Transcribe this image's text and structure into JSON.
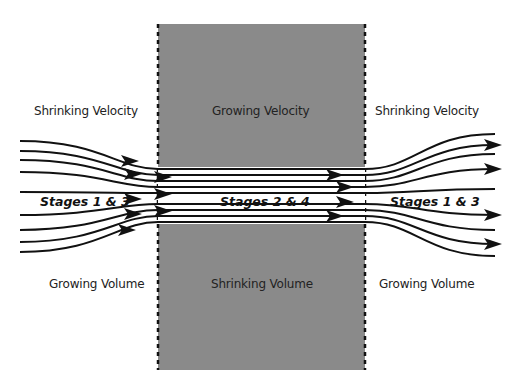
{
  "colors": {
    "background": "#ffffff",
    "nozzle_fill": "#8a8a8a",
    "border_dash": "#111111",
    "streamline": "#111111",
    "channel_fill": "#ffffff"
  },
  "regions": {
    "left": {
      "top_label": "Shrinking Velocity",
      "stage_label": "Stages 1 & 3",
      "bottom_label": "Growing Volume"
    },
    "middle": {
      "top_label": "Growing Velocity",
      "stage_label": "Stages 2 & 4",
      "bottom_label": "Shrinking Volume"
    },
    "right": {
      "top_label": "Shrinking Velocity",
      "stage_label": "Stages 1 & 3",
      "bottom_label": "Growing Volume"
    }
  },
  "geometry": {
    "box": {
      "x": 158,
      "y": 24,
      "width": 207,
      "height": 346
    },
    "channel": {
      "top": 167,
      "bottom": 224
    },
    "left_edge_y": [
      141,
      151,
      160,
      172,
      192,
      215,
      230,
      242,
      252
    ],
    "channel_y": [
      169,
      175,
      181,
      187,
      193,
      204,
      210,
      216,
      222
    ],
    "right_edge_y": [
      134,
      145,
      154,
      169,
      189,
      215,
      230,
      244,
      256
    ]
  },
  "arrows": {
    "left": [
      [
        125,
        161
      ],
      [
        128,
        174
      ],
      [
        158,
        177
      ],
      [
        158,
        194
      ],
      [
        128,
        199
      ],
      [
        158,
        211
      ],
      [
        128,
        214
      ],
      [
        122,
        230
      ]
    ],
    "middle": [
      [
        330,
        175
      ],
      [
        340,
        187
      ],
      [
        340,
        202
      ],
      [
        330,
        216
      ]
    ],
    "right": [
      [
        488,
        145
      ],
      [
        488,
        169
      ],
      [
        488,
        215
      ],
      [
        488,
        244
      ]
    ]
  }
}
